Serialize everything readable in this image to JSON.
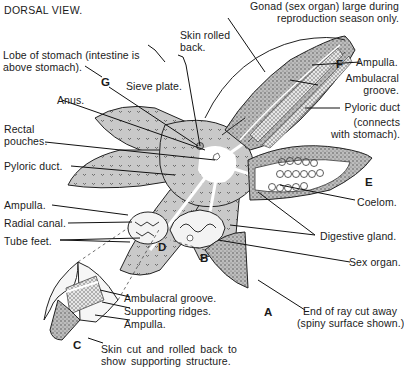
{
  "title": "DORSAL VIEW.",
  "colors": {
    "body_fill": "#c8c8c8",
    "line": "#1a1a1a",
    "background": "#ffffff"
  },
  "labels": {
    "gonad_1": "Gonad (sex organ) large during",
    "gonad_2": "reproduction season only.",
    "skin_rolled_1": "Skin rolled",
    "skin_rolled_2": "back.",
    "lobe_1": "Lobe of stomach (intestine is",
    "lobe_2": "above stomach).",
    "sieve_plate": "Sieve plate.",
    "anus": "Anus.",
    "rectal_1": "Rectal",
    "rectal_2": "pouches.",
    "pyloric_duct_left": "Pyloric duct.",
    "ampulla_left": "Ampulla.",
    "radial_canal": "Radial canal.",
    "tube_feet": "Tube feet.",
    "ampulla_right": "Ampulla.",
    "ambulacral_1": "Ambulacral",
    "ambulacral_2": "groove.",
    "pyloric_right_1": "Pyloric duct",
    "pyloric_right_2": "(connects",
    "pyloric_right_3": "with stomach).",
    "coelom": "Coelom.",
    "digestive_gland": "Digestive gland.",
    "sex_organ": "Sex organ.",
    "end_ray_1": "End of ray cut away",
    "end_ray_2": "(spiny surface shown.)",
    "c_ambulacral": "Ambulacral groove.",
    "c_supporting": "Supporting ridges.",
    "c_ampulla": "Ampulla.",
    "skin_cut_1": "Skin cut and rolled back to",
    "skin_cut_2": "show supporting structure."
  },
  "letters": {
    "A": "A",
    "B": "B",
    "C": "C",
    "D": "D",
    "E": "E",
    "F": "F",
    "G": "G"
  }
}
